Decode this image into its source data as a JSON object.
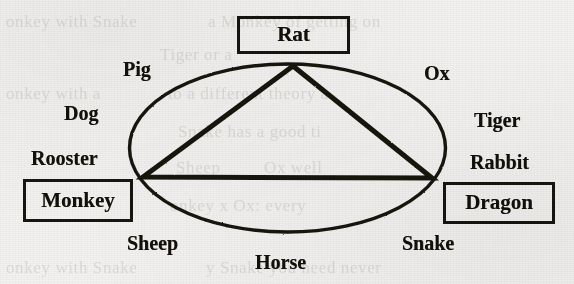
{
  "diagram": {
    "background_color": "#f3f2f0",
    "ink_color": "#17150f",
    "ellipse": {
      "cx": 287.5,
      "cy": 148,
      "rx": 158,
      "ry": 84,
      "stroke_width": 3.4
    },
    "triangle": {
      "stroke_width": 5,
      "vertices": [
        {
          "name": "apex-rat",
          "x": 293,
          "y": 66
        },
        {
          "name": "left-monkey",
          "x": 143,
          "y": 177
        },
        {
          "name": "right-dragon",
          "x": 432,
          "y": 178
        }
      ]
    },
    "boxed_labels": [
      {
        "id": "rat",
        "text": "Rat",
        "x": 237,
        "y": 16,
        "w": 113,
        "h": 38
      },
      {
        "id": "monkey",
        "text": "Monkey",
        "x": 23,
        "y": 179,
        "w": 110,
        "h": 43
      },
      {
        "id": "dragon",
        "text": "Dragon",
        "x": 443,
        "y": 182,
        "w": 112,
        "h": 42
      }
    ],
    "plain_labels": [
      {
        "id": "pig",
        "text": "Pig",
        "x": 123,
        "y": 59
      },
      {
        "id": "ox",
        "text": "Ox",
        "x": 424,
        "y": 63
      },
      {
        "id": "dog",
        "text": "Dog",
        "x": 64,
        "y": 103
      },
      {
        "id": "tiger",
        "text": "Tiger",
        "x": 474,
        "y": 110
      },
      {
        "id": "rooster",
        "text": "Rooster",
        "x": 31,
        "y": 148
      },
      {
        "id": "rabbit",
        "text": "Rabbit",
        "x": 470,
        "y": 152
      },
      {
        "id": "sheep",
        "text": "Sheep",
        "x": 127,
        "y": 233
      },
      {
        "id": "snake",
        "text": "Snake",
        "x": 402,
        "y": 233
      },
      {
        "id": "horse",
        "text": "Horse",
        "x": 255,
        "y": 252
      }
    ]
  },
  "bleed_through": [
    {
      "id": "bleed-1",
      "text": "onkey with Snake",
      "x": 6,
      "y": 12,
      "size": 17
    },
    {
      "id": "bleed-2",
      "text": "a Monkey of getting on",
      "x": 208,
      "y": 12,
      "size": 17
    },
    {
      "id": "bleed-3",
      "text": "Tiger or a",
      "x": 160,
      "y": 45,
      "size": 17
    },
    {
      "id": "bleed-4",
      "text": "onkey with a",
      "x": 6,
      "y": 84,
      "size": 17
    },
    {
      "id": "bleed-5",
      "text": "to a different theory a",
      "x": 168,
      "y": 84,
      "size": 17
    },
    {
      "id": "bleed-6",
      "text": "Snake has a good ti",
      "x": 178,
      "y": 122,
      "size": 17
    },
    {
      "id": "bleed-7",
      "text": "Sheep",
      "x": 176,
      "y": 158,
      "size": 17
    },
    {
      "id": "bleed-8",
      "text": "Ox well",
      "x": 264,
      "y": 158,
      "size": 17
    },
    {
      "id": "bleed-9",
      "text": "onkey x Ox: every",
      "x": 170,
      "y": 196,
      "size": 17
    },
    {
      "id": "bleed-10",
      "text": "onkey with Snake",
      "x": 6,
      "y": 258,
      "size": 17
    },
    {
      "id": "bleed-11",
      "text": "y Snake you need never",
      "x": 206,
      "y": 258,
      "size": 17
    }
  ]
}
